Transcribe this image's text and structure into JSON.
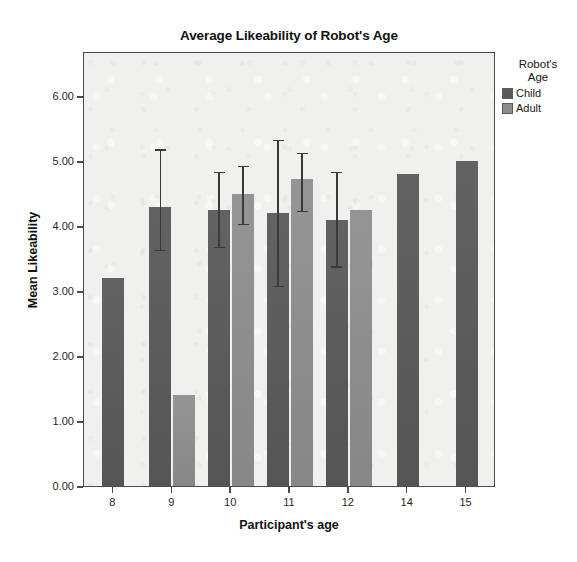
{
  "chart_data": {
    "type": "bar",
    "title": "Average Likeability of Robot's Age",
    "xlabel": "Participant's age",
    "ylabel": "Mean Likeability",
    "categories": [
      "8",
      "9",
      "10",
      "11",
      "12",
      "14",
      "15"
    ],
    "ylim": [
      0,
      6.4
    ],
    "ytick_labels": [
      "0.00",
      "1.00",
      "2.00",
      "3.00",
      "4.00",
      "5.00",
      "6.00"
    ],
    "ytick_values": [
      0,
      1,
      2,
      3,
      4,
      5,
      6
    ],
    "grid": false,
    "legend_position": "right",
    "legend_title": "Robot's\nAge",
    "series": [
      {
        "name": "Child",
        "color": "#5a5a5a",
        "values": [
          3.2,
          4.3,
          4.25,
          4.2,
          4.1,
          4.8,
          5.0
        ],
        "err_low": [
          null,
          3.65,
          3.7,
          3.1,
          3.4,
          null,
          null
        ],
        "err_high": [
          null,
          5.2,
          4.85,
          5.35,
          4.85,
          null,
          null
        ]
      },
      {
        "name": "Adult",
        "color": "#8e8e8e",
        "values": [
          null,
          1.4,
          4.5,
          4.72,
          4.25,
          null,
          null
        ],
        "err_low": [
          null,
          null,
          4.05,
          4.25,
          null,
          null,
          null
        ],
        "err_high": [
          null,
          null,
          4.95,
          5.15,
          null,
          null,
          null
        ]
      }
    ]
  },
  "legend": {
    "title": "Robot's\nAge",
    "entries": [
      {
        "label": "Child",
        "color": "#5a5a5a"
      },
      {
        "label": "Adult",
        "color": "#8e8e8e"
      }
    ]
  }
}
